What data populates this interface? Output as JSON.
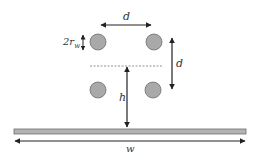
{
  "diagram": {
    "labels": {
      "top_spacing": "d",
      "diameter_main": "2r",
      "diameter_sub": "w",
      "vertical_spacing": "d",
      "height": "h",
      "width": "w"
    },
    "colors": {
      "conductor_fill": "#a9a9a9",
      "conductor_stroke": "#6e6e6e",
      "plate_fill": "#b3b3b3",
      "plate_stroke": "#6e6e6e",
      "arrow": "#222222",
      "dashed": "#777777"
    },
    "conductors": [
      {
        "cx": 98,
        "cy": 42,
        "r": 8
      },
      {
        "cx": 154,
        "cy": 42,
        "r": 8
      },
      {
        "cx": 98,
        "cy": 90,
        "r": 8
      },
      {
        "cx": 153,
        "cy": 90,
        "r": 8
      }
    ]
  }
}
